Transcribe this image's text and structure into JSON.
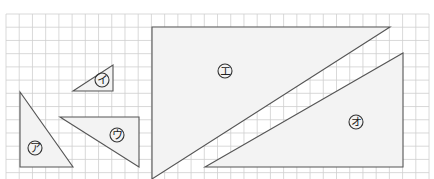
{
  "figure": {
    "grid": {
      "columns": 32,
      "rows": 12
    },
    "shapes": [
      {
        "id": "a",
        "label": "ア",
        "kind": "right-triangle"
      },
      {
        "id": "i",
        "label": "イ",
        "kind": "right-triangle"
      },
      {
        "id": "u",
        "label": "ウ",
        "kind": "right-triangle"
      },
      {
        "id": "e",
        "label": "エ",
        "kind": "pentagon"
      },
      {
        "id": "o",
        "label": "オ",
        "kind": "right-triangle"
      }
    ]
  },
  "colors": {
    "grid": "#cfcfcf",
    "shape_fill": "#f3f3f3",
    "shape_stroke": "#555555",
    "label": "#222222"
  }
}
